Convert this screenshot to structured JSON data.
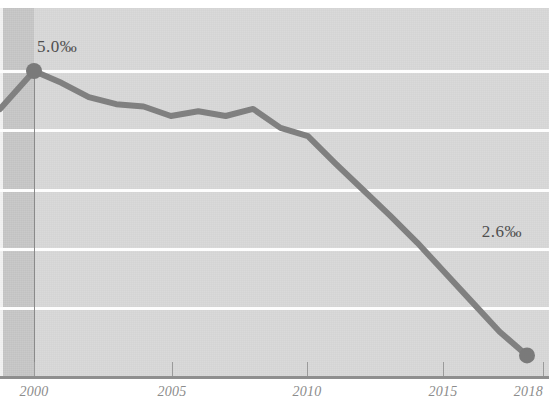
{
  "chart_data": {
    "type": "line",
    "title": "",
    "subtitle": "",
    "xlabel": "",
    "ylabel": "",
    "unit": "‰",
    "grid": true,
    "legend": "none",
    "xlim": [
      2000,
      2018
    ],
    "ylim": [
      2.0,
      5.4
    ],
    "x_tick_labels": [
      "2000",
      "2005",
      "2010",
      "2015",
      "2018"
    ],
    "x_ticks": [
      2000,
      2005,
      2010,
      2015,
      2018
    ],
    "y_gridlines": [
      5.0,
      4.5,
      4.0,
      3.5,
      3.0
    ],
    "series": [
      {
        "name": "rate",
        "color": "#808080",
        "x": [
          2000,
          2001,
          2002,
          2003,
          2004,
          2005,
          2006,
          2007,
          2008,
          2009,
          2010,
          2011,
          2012,
          2013,
          2014,
          2015,
          2016,
          2017,
          2018
        ],
        "values": [
          5.0,
          4.9,
          4.78,
          4.72,
          4.7,
          4.62,
          4.66,
          4.62,
          4.68,
          4.52,
          4.45,
          4.22,
          4.0,
          3.78,
          3.55,
          3.3,
          3.05,
          2.8,
          2.6
        ]
      }
    ],
    "annotations": [
      {
        "name": "start-value",
        "label": "5.0‰",
        "x": 2000,
        "y": 5.0
      },
      {
        "name": "end-value",
        "label": "2.6‰",
        "x": 2018,
        "y": 2.6
      }
    ],
    "markers": [
      {
        "name": "start-marker",
        "x": 2000,
        "y": 5.0
      },
      {
        "name": "end-marker",
        "x": 2018,
        "y": 2.6
      }
    ],
    "colors": {
      "plot_background": "#d8d8d8",
      "left_band": "#c6c6c6",
      "gridline": "#fdfdfd",
      "line": "#808080",
      "marker": "#7a7a7a",
      "axis": "#8e8e8e",
      "tick_label": "#8c8c8c",
      "value_label": "#4f4f4f"
    }
  },
  "axis": {
    "ticks": [
      {
        "label": "2000",
        "x_px": 34,
        "align": "center"
      },
      {
        "label": "2005",
        "x_px": 172,
        "align": "center"
      },
      {
        "label": "2010",
        "x_px": 307,
        "align": "center"
      },
      {
        "label": "2015",
        "x_px": 443,
        "align": "center"
      },
      {
        "label": "2018",
        "x_px": 543,
        "align": "right"
      }
    ]
  },
  "labels": {
    "start": "5.0‰",
    "end": "2.6‰"
  }
}
